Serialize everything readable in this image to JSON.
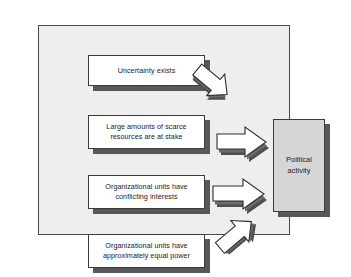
{
  "figure": {
    "frame": {
      "present": true,
      "border_color": "#4a4a4a",
      "background": "#eeeeec"
    }
  },
  "diagram": {
    "type": "cause-effect",
    "direction": "left-to-right",
    "causes": [
      {
        "id": "uncertainty",
        "label": "Uncertainty exists"
      },
      {
        "id": "resources",
        "label": "Large amounts of scarce\nresources are at stake"
      },
      {
        "id": "conflicting",
        "label": "Organizational units have\nconflicting interests"
      },
      {
        "id": "equal-power",
        "label": "Organizational units have\napproximately equal power"
      }
    ],
    "effect": {
      "id": "political-activity",
      "label": "Political\nactivity"
    },
    "arrows": [
      {
        "from": "uncertainty",
        "to": "political-activity",
        "orientation": "down-right"
      },
      {
        "from": "resources",
        "to": "political-activity",
        "orientation": "right"
      },
      {
        "from": "conflicting",
        "to": "political-activity",
        "orientation": "right"
      },
      {
        "from": "equal-power",
        "to": "political-activity",
        "orientation": "up-right"
      }
    ],
    "colors": {
      "cause_box_fill": "#ffffff",
      "effect_box_fill": "#d6d6d6",
      "box_border": "#3c3c3c",
      "shadow": "#58585a",
      "arrow_fill": "#ffffff",
      "arrow_shade": "#6b6b6b",
      "arrow_outline": "#2d2d2d",
      "text": "#1a1a1a"
    }
  }
}
